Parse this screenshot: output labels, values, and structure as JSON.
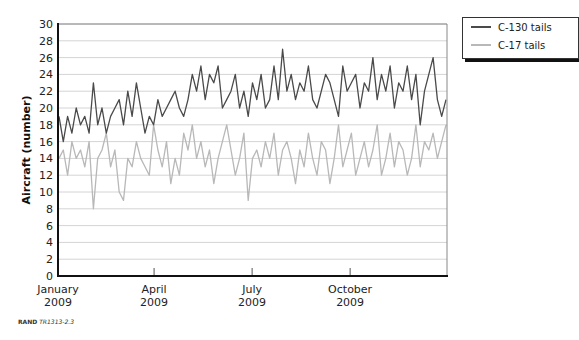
{
  "chart_data": {
    "type": "line",
    "title": "",
    "xlabel": "",
    "ylabel": "Aircraft (number)",
    "ylim": [
      0,
      30
    ],
    "yticks": [
      0,
      2,
      4,
      6,
      8,
      10,
      12,
      14,
      16,
      18,
      20,
      22,
      24,
      26,
      28,
      30
    ],
    "grid": true,
    "legend_position": "top-right outside",
    "x_ticks": [
      {
        "label": "January",
        "year": "2009",
        "frac": 0.0
      },
      {
        "label": "April",
        "year": "2009",
        "frac": 0.247
      },
      {
        "label": "July",
        "year": "2009",
        "frac": 0.499
      },
      {
        "label": "October",
        "year": "2009",
        "frac": 0.751
      }
    ],
    "x_range": "January 2009 – December 2009 (daily)",
    "series": [
      {
        "name": "C-130 tails",
        "color": "#4a4a4a",
        "values": [
          19,
          16,
          19,
          17,
          20,
          18,
          19,
          17,
          23,
          18,
          20,
          17,
          19,
          20,
          21,
          18,
          22,
          19,
          23,
          20,
          17,
          19,
          18,
          21,
          19,
          20,
          21,
          22,
          20,
          19,
          21,
          24,
          22,
          25,
          21,
          24,
          23,
          25,
          20,
          21,
          22,
          24,
          20,
          22,
          19,
          23,
          21,
          24,
          20,
          21,
          25,
          21,
          27,
          22,
          24,
          21,
          23,
          22,
          25,
          21,
          20,
          22,
          24,
          23,
          21,
          19,
          25,
          22,
          23,
          24,
          20,
          23,
          22,
          26,
          21,
          24,
          22,
          25,
          20,
          23,
          22,
          25,
          21,
          24,
          18,
          22,
          24,
          26,
          21,
          19,
          21
        ]
      },
      {
        "name": "C-17 tails",
        "color": "#b8b8b8",
        "values": [
          14,
          15,
          12,
          16,
          14,
          15,
          13,
          16,
          8,
          14,
          15,
          17,
          13,
          15,
          10,
          9,
          14,
          13,
          16,
          14,
          13,
          12,
          18,
          15,
          13,
          16,
          11,
          14,
          12,
          17,
          15,
          18,
          14,
          16,
          13,
          15,
          11,
          14,
          16,
          18,
          15,
          12,
          14,
          17,
          9,
          14,
          15,
          13,
          16,
          14,
          17,
          12,
          15,
          16,
          14,
          11,
          15,
          13,
          17,
          14,
          12,
          16,
          15,
          11,
          14,
          18,
          13,
          15,
          17,
          12,
          14,
          16,
          13,
          15,
          18,
          12,
          14,
          17,
          13,
          16,
          15,
          12,
          14,
          18,
          13,
          16,
          15,
          17,
          14,
          16,
          18
        ]
      }
    ]
  },
  "legend": {
    "items": [
      {
        "label": "C-130 tails",
        "color": "#4a4a4a"
      },
      {
        "label": "C-17 tails",
        "color": "#b8b8b8"
      }
    ]
  },
  "source": {
    "org": "RAND",
    "id": "TR1313-2.3"
  }
}
